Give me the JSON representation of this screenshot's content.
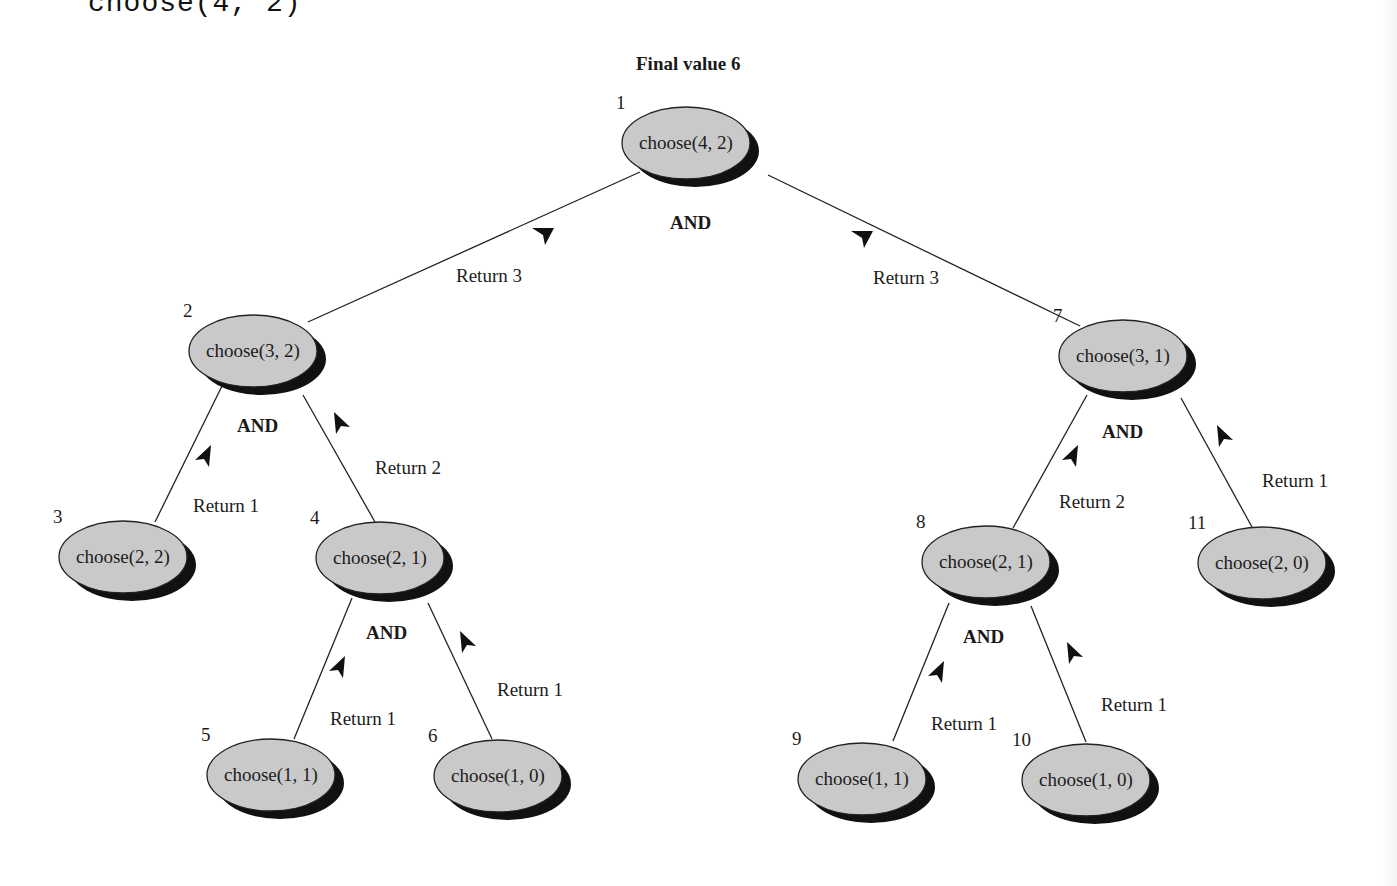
{
  "header": {
    "code_title": "choose(4, 2)",
    "final_value_label": "Final value 6"
  },
  "style": {
    "node_fill": "#c9c9c9",
    "node_shadow": "#111111",
    "line_color": "#222222"
  },
  "nodes": [
    {
      "id": 1,
      "num": "1",
      "label": "choose(4, 2)",
      "cx": 686,
      "cy": 143,
      "rx": 64,
      "ry": 36
    },
    {
      "id": 2,
      "num": "2",
      "label": "choose(3, 2)",
      "cx": 253,
      "cy": 351,
      "rx": 64,
      "ry": 36
    },
    {
      "id": 3,
      "num": "3",
      "label": "choose(2, 2)",
      "cx": 123,
      "cy": 557,
      "rx": 64,
      "ry": 36
    },
    {
      "id": 4,
      "num": "4",
      "label": "choose(2, 1)",
      "cx": 380,
      "cy": 558,
      "rx": 64,
      "ry": 36
    },
    {
      "id": 5,
      "num": "5",
      "label": "choose(1, 1)",
      "cx": 271,
      "cy": 775,
      "rx": 64,
      "ry": 36
    },
    {
      "id": 6,
      "num": "6",
      "label": "choose(1, 0)",
      "cx": 498,
      "cy": 776,
      "rx": 64,
      "ry": 36
    },
    {
      "id": 7,
      "num": "7",
      "label": "choose(3, 1)",
      "cx": 1123,
      "cy": 356,
      "rx": 64,
      "ry": 36
    },
    {
      "id": 8,
      "num": "8",
      "label": "choose(2, 1)",
      "cx": 986,
      "cy": 562,
      "rx": 64,
      "ry": 36
    },
    {
      "id": 9,
      "num": "9",
      "label": "choose(1, 1)",
      "cx": 862,
      "cy": 779,
      "rx": 64,
      "ry": 36
    },
    {
      "id": 10,
      "num": "10",
      "label": "choose(1, 0)",
      "cx": 1086,
      "cy": 780,
      "rx": 64,
      "ry": 36
    },
    {
      "id": 11,
      "num": "11",
      "label": "choose(2, 0)",
      "cx": 1262,
      "cy": 563,
      "rx": 64,
      "ry": 36
    }
  ],
  "edges": [
    {
      "from": 1,
      "to": 2,
      "x1": 640,
      "y1": 172,
      "x2": 308,
      "y2": 322,
      "return_label": "Return 3",
      "lx": 456,
      "ly": 282,
      "ax": 543,
      "ay": 235,
      "arrow_dir": "down"
    },
    {
      "from": 1,
      "to": 7,
      "x1": 768,
      "y1": 175,
      "x2": 1080,
      "y2": 326,
      "return_label": "Return 3",
      "lx": 873,
      "ly": 284,
      "ax": 862,
      "ay": 238,
      "arrow_dir": "down"
    },
    {
      "from": 2,
      "to": 3,
      "x1": 222,
      "y1": 386,
      "x2": 155,
      "y2": 522,
      "return_label": "Return 1",
      "lx": 193,
      "ly": 512,
      "ax": 205,
      "ay": 457,
      "arrow_dir": "up-left"
    },
    {
      "from": 2,
      "to": 4,
      "x1": 303,
      "y1": 395,
      "x2": 375,
      "y2": 522,
      "return_label": "Return 2",
      "lx": 375,
      "ly": 474,
      "ax": 340,
      "ay": 424,
      "arrow_dir": "up-right"
    },
    {
      "from": 4,
      "to": 5,
      "x1": 352,
      "y1": 598,
      "x2": 294,
      "y2": 739,
      "return_label": "Return 1",
      "lx": 330,
      "ly": 725,
      "ax": 339,
      "ay": 668,
      "arrow_dir": "up-left"
    },
    {
      "from": 4,
      "to": 6,
      "x1": 428,
      "y1": 603,
      "x2": 492,
      "y2": 739,
      "return_label": "Return 1",
      "lx": 497,
      "ly": 696,
      "ax": 466,
      "ay": 643,
      "arrow_dir": "up-right"
    },
    {
      "from": 7,
      "to": 8,
      "x1": 1087,
      "y1": 395,
      "x2": 1013,
      "y2": 528,
      "return_label": "Return 2",
      "lx": 1059,
      "ly": 508,
      "ax": 1072,
      "ay": 457,
      "arrow_dir": "up-left"
    },
    {
      "from": 7,
      "to": 11,
      "x1": 1181,
      "y1": 398,
      "x2": 1252,
      "y2": 527,
      "return_label": "Return 1",
      "lx": 1262,
      "ly": 487,
      "ax": 1223,
      "ay": 437,
      "arrow_dir": "up-right"
    },
    {
      "from": 8,
      "to": 9,
      "x1": 949,
      "y1": 603,
      "x2": 893,
      "y2": 741,
      "return_label": "Return 1",
      "lx": 931,
      "ly": 730,
      "ax": 938,
      "ay": 673,
      "arrow_dir": "up-left"
    },
    {
      "from": 8,
      "to": 10,
      "x1": 1031,
      "y1": 606,
      "x2": 1086,
      "y2": 742,
      "return_label": "Return 1",
      "lx": 1101,
      "ly": 711,
      "ax": 1073,
      "ay": 654,
      "arrow_dir": "up-right"
    }
  ],
  "and_labels": [
    {
      "node": 1,
      "text": "AND",
      "x": 670,
      "y": 229
    },
    {
      "node": 2,
      "text": "AND",
      "x": 237,
      "y": 432
    },
    {
      "node": 4,
      "text": "AND",
      "x": 366,
      "y": 639
    },
    {
      "node": 7,
      "text": "AND",
      "x": 1102,
      "y": 438
    },
    {
      "node": 8,
      "text": "AND",
      "x": 963,
      "y": 643
    }
  ]
}
